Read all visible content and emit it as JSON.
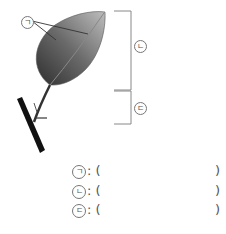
{
  "figure": {
    "labels": [
      {
        "id": "a",
        "symbol": "ㄱ",
        "target": "leaf veins"
      },
      {
        "id": "b",
        "symbol": "ㄴ",
        "target": "leaf blade"
      },
      {
        "id": "c",
        "symbol": "ㄷ",
        "target": "petiole"
      }
    ]
  },
  "answers": [
    {
      "symbol": "ㄱ",
      "prefix": ":",
      "open": "(",
      "value": "",
      "close": ")"
    },
    {
      "symbol": "ㄴ",
      "prefix": ":",
      "open": "(",
      "value": "",
      "close": ")"
    },
    {
      "symbol": "ㄷ",
      "prefix": ":",
      "open": "(",
      "value": "",
      "close": ")"
    }
  ]
}
